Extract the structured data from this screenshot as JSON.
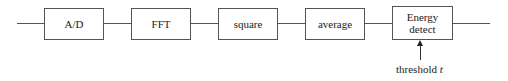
{
  "diagram": {
    "type": "block-diagram",
    "blocks": [
      {
        "id": "ad",
        "label": "A/D"
      },
      {
        "id": "fft",
        "label": "FFT"
      },
      {
        "id": "square",
        "label": "square"
      },
      {
        "id": "average",
        "label": "average"
      },
      {
        "id": "energy",
        "label_line1": "Energy",
        "label_line2": "detect"
      }
    ],
    "threshold": {
      "text": "threshold",
      "var": "t"
    },
    "connections": [
      [
        "input",
        "ad"
      ],
      [
        "ad",
        "fft"
      ],
      [
        "fft",
        "square"
      ],
      [
        "square",
        "average"
      ],
      [
        "average",
        "energy"
      ],
      [
        "energy",
        "output"
      ],
      [
        "threshold",
        "energy"
      ]
    ]
  }
}
